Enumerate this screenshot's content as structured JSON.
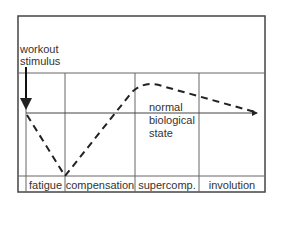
{
  "diagram": {
    "stimulus_label_line1": "workout",
    "stimulus_label_line2": "stimulus",
    "baseline_label_line1": "normal",
    "baseline_label_line2": "biological",
    "baseline_label_line3": "state",
    "phases": [
      {
        "label": "fatigue"
      },
      {
        "label": "compensation"
      },
      {
        "label": "supercomp."
      },
      {
        "label": "involution"
      }
    ],
    "colors": {
      "line": "#222222",
      "grid": "#555555",
      "text": "#333333"
    }
  }
}
